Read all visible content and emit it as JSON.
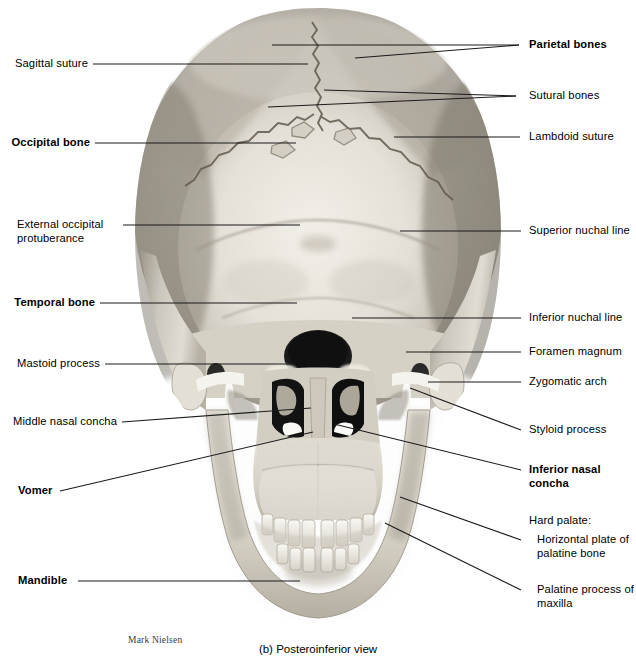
{
  "figure": {
    "caption": "(b) Posteroinferior view",
    "credit": "Mark Nielsen",
    "background_color": "#ffffff",
    "leader_line_color": "#1a1a1a",
    "bone_light_color": "#f2efe9",
    "bone_mid_color": "#c9c4ba",
    "bone_shadow_color": "#8d877d",
    "cavity_color": "#1c1c1c"
  },
  "labels_left": [
    {
      "id": "sagittal-suture",
      "text": "Sagittal suture",
      "bold": false
    },
    {
      "id": "occipital-bone",
      "text": "Occipital bone",
      "bold": true
    },
    {
      "id": "external-occipital-protuberance",
      "text": "External occipital\nprotuberance",
      "bold": false
    },
    {
      "id": "temporal-bone",
      "text": "Temporal bone",
      "bold": true
    },
    {
      "id": "mastoid-process",
      "text": "Mastoid process",
      "bold": false
    },
    {
      "id": "middle-nasal-concha",
      "text": "Middle nasal concha",
      "bold": false
    },
    {
      "id": "vomer",
      "text": "Vomer",
      "bold": true
    },
    {
      "id": "mandible",
      "text": "Mandible",
      "bold": true
    }
  ],
  "labels_right": [
    {
      "id": "parietal-bones",
      "text": "Parietal bones",
      "bold": true
    },
    {
      "id": "sutural-bones",
      "text": "Sutural bones",
      "bold": false
    },
    {
      "id": "lambdoid-suture",
      "text": "Lambdoid suture",
      "bold": false
    },
    {
      "id": "superior-nuchal-line",
      "text": "Superior nuchal line",
      "bold": false
    },
    {
      "id": "inferior-nuchal-line",
      "text": "Inferior nuchal line",
      "bold": false
    },
    {
      "id": "foramen-magnum",
      "text": "Foramen magnum",
      "bold": false
    },
    {
      "id": "zygomatic-arch",
      "text": "Zygomatic arch",
      "bold": false
    },
    {
      "id": "styloid-process",
      "text": "Styloid process",
      "bold": false
    },
    {
      "id": "inferior-nasal-concha",
      "text": "Inferior nasal\nconcha",
      "bold": true
    },
    {
      "id": "hard-palate-heading",
      "text": "Hard palate:",
      "bold": false
    },
    {
      "id": "horizontal-plate-palatine-bone",
      "text": "Horizontal plate of\npalatine bone",
      "bold": false
    },
    {
      "id": "palatine-process-maxilla",
      "text": "Palatine process of\nmaxilla",
      "bold": false
    }
  ]
}
